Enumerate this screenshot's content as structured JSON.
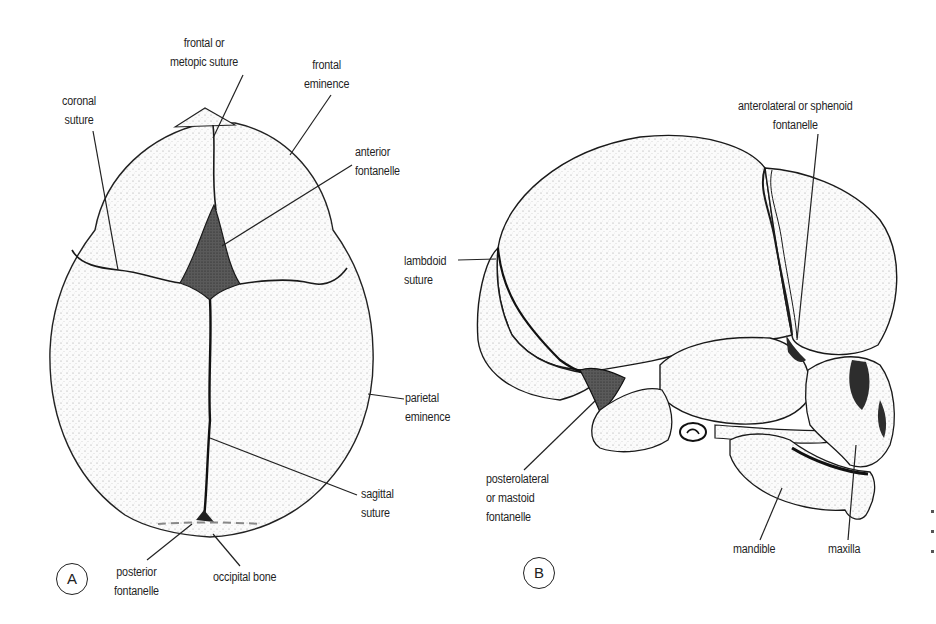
{
  "figure": {
    "panels": [
      {
        "id": "A",
        "letter": "A",
        "view": "superior view of newborn skull",
        "labels": {
          "frontal_suture": "frontal or\nmetopic suture",
          "frontal_eminence": "frontal\neminence",
          "coronal_suture": "coronal\nsuture",
          "anterior_fontanelle": "anterior\nfontanelle",
          "parietal_eminence": "parietal\neminence",
          "sagittal_suture": "sagittal\nsuture",
          "posterior_fontanelle": "posterior\nfontanelle",
          "occipital_bone": "occipital bone"
        }
      },
      {
        "id": "B",
        "letter": "B",
        "view": "lateral view of newborn skull",
        "labels": {
          "lambdoid_suture": "lambdoid\nsuture",
          "sphenoid_fontanelle": "anterolateral or sphenoid\nfontanelle",
          "mastoid_fontanelle": "posterolateral\nor mastoid\nfontanelle",
          "mandible": "mandible",
          "maxilla": "maxilla"
        }
      }
    ],
    "colors": {
      "ink": "#1a1a1a",
      "bone_fill": "#f4f4f4",
      "fontanelle_fill": "#3a3a3a",
      "background": "#ffffff"
    }
  }
}
